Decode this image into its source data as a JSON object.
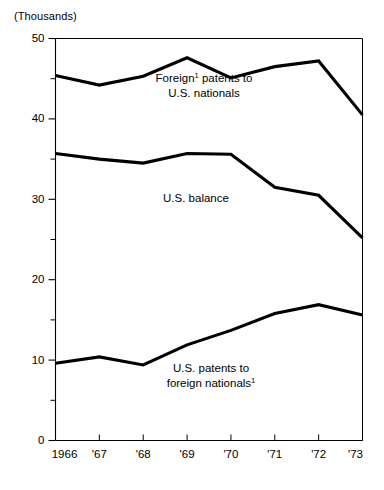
{
  "chart_data": {
    "type": "line",
    "title": "",
    "subtitle": "",
    "units_label": "(Thousands)",
    "xlabel": "",
    "ylabel": "",
    "grid": false,
    "legend_position": "inline-annotations",
    "x": [
      1966,
      1967,
      1968,
      1969,
      1970,
      1971,
      1972,
      1973
    ],
    "categories": [
      "1966",
      "'67",
      "'68",
      "'69",
      "'70",
      "'71",
      "'72",
      "'73"
    ],
    "xlim": [
      1966,
      1973
    ],
    "ylim": [
      0,
      50
    ],
    "ytick_values": [
      0,
      10,
      20,
      30,
      40,
      50
    ],
    "ytick_labels": [
      "0",
      "10",
      "20",
      "30",
      "40",
      "50"
    ],
    "yminor_values": [
      5,
      15,
      25,
      35,
      45
    ],
    "series": [
      {
        "name": "Foreign patents to U.S. nationals",
        "label_line1": "Foreign",
        "label_sup1": "1",
        "label_line1_rest": " patents to",
        "label_line2": "U.S. nationals",
        "label_sup2": "",
        "values": [
          45.4,
          44.2,
          45.3,
          47.6,
          45.1,
          46.5,
          47.2,
          40.5
        ]
      },
      {
        "name": "U.S. balance",
        "label_line1": "U.S. balance",
        "label_sup1": "",
        "label_line1_rest": "",
        "label_line2": "",
        "label_sup2": "",
        "values": [
          35.7,
          35.0,
          34.5,
          35.7,
          35.6,
          31.5,
          30.5,
          25.2
        ]
      },
      {
        "name": "U.S. patents to foreign nationals",
        "label_line1": "U.S. patents to",
        "label_sup1": "",
        "label_line1_rest": "",
        "label_line2": "foreign nationals",
        "label_sup2": "1",
        "values": [
          9.6,
          10.4,
          9.4,
          11.9,
          13.7,
          15.8,
          16.9,
          15.6
        ]
      }
    ]
  },
  "colors": {
    "line": "#000000",
    "axis": "#000000",
    "background": "#ffffff"
  }
}
